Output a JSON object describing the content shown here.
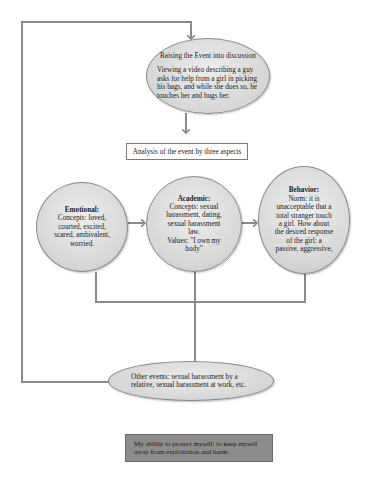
{
  "diagram": {
    "top_node": {
      "title": "Raising the Event into discussion",
      "body": "Viewing a video describing a guy asks for help from a girl in picking his bags, and while she does so, he touches her and hugs her."
    },
    "analysis_box": {
      "label": "Analysis of the event by three aspects"
    },
    "aspects": [
      {
        "title": "Emotional:",
        "lines": [
          "Concepts: loved,",
          "courted, excited,",
          "scared, ambivalent,",
          "worried."
        ]
      },
      {
        "title": "Academic:",
        "lines": [
          "Concepts: sexual",
          "harassment, dating,",
          "sexual harassment",
          "law.",
          "Values: \"I own my",
          "body\""
        ]
      },
      {
        "title": "Behavior:",
        "lines": [
          "Norm: it is",
          "unacceptable that a",
          "total stranger touch",
          "a girl. How about",
          "the desired response",
          "of the girl: a",
          "passive, aggressive,"
        ]
      }
    ],
    "other_events": {
      "label": "Other events: sexual harassment by a relative, sexual harassment at work, etc."
    },
    "outcome_box": {
      "label": "My ability to protect myself; to keep myself away from exploitation and harm."
    },
    "colors": {
      "line": "#8a8a8a",
      "node_fill": "#d8d8d8",
      "outcome_fill": "#8c8c8c"
    }
  }
}
